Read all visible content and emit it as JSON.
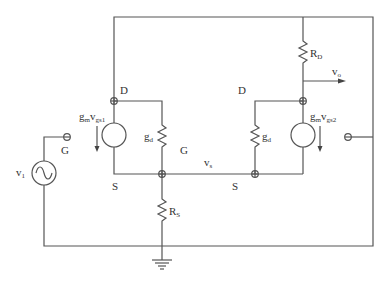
{
  "diagram": {
    "type": "circuit-schematic",
    "labels": {
      "left_drain": "D",
      "right_drain": "D",
      "left_source": "S",
      "right_source": "S",
      "left_gate": "G",
      "middle_gate": "G",
      "left_current_source": {
        "base": "g",
        "sub1": "m",
        "mid": "v",
        "sub2": "gs1"
      },
      "right_current_source": {
        "base": "g",
        "sub1": "m",
        "mid": "v",
        "sub2": "gs2"
      },
      "left_gd": {
        "base": "g",
        "sub": "d"
      },
      "right_gd": {
        "base": "g",
        "sub": "d"
      },
      "rd": {
        "base": "R",
        "sub": "D"
      },
      "rs": {
        "base": "R",
        "sub": "S"
      },
      "vs": {
        "base": "v",
        "sub": "s"
      },
      "vo": {
        "base": "v",
        "sub": "o"
      },
      "vi": {
        "base": "v",
        "sub": "1"
      }
    },
    "components": [
      {
        "id": "vi",
        "kind": "ac-voltage-source"
      },
      {
        "id": "gm_vgs1",
        "kind": "dependent-current-source",
        "direction": "down"
      },
      {
        "id": "gd_left",
        "kind": "resistor"
      },
      {
        "id": "gm_vgs2",
        "kind": "dependent-current-source",
        "direction": "down"
      },
      {
        "id": "gd_right",
        "kind": "resistor"
      },
      {
        "id": "RD",
        "kind": "resistor"
      },
      {
        "id": "RS",
        "kind": "resistor"
      },
      {
        "id": "ground",
        "kind": "ground"
      }
    ],
    "colors": {
      "wire": "#555555",
      "text": "#333333",
      "background": "#ffffff"
    }
  }
}
